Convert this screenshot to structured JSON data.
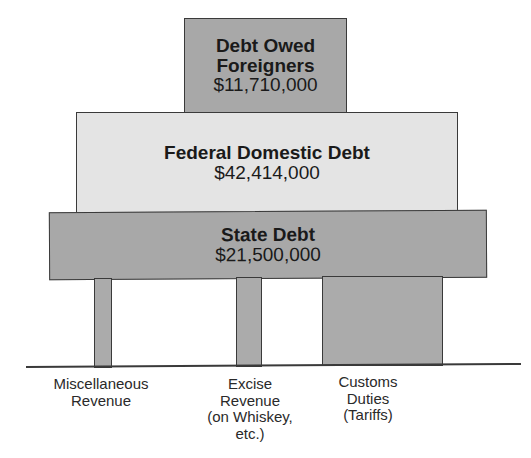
{
  "diagram": {
    "blocks": {
      "foreign_debt": {
        "title_line1": "Debt Owed",
        "title_line2": "Foreigners",
        "amount": "$11,710,000"
      },
      "federal_domestic_debt": {
        "title": "Federal Domestic Debt",
        "amount": "$42,414,000"
      },
      "state_debt": {
        "title": "State Debt",
        "amount": "$21,500,000"
      }
    },
    "supports": [
      {
        "label_lines": [
          "Miscellaneous",
          "Revenue"
        ]
      },
      {
        "label_lines": [
          "Excise",
          "Revenue",
          "(on Whiskey,",
          "etc.)"
        ]
      },
      {
        "label_lines": [
          "Customs",
          "Duties",
          "(Tariffs)"
        ]
      }
    ],
    "colors": {
      "dark_fill": "#a8a8a8",
      "light_fill": "#e4e4e4",
      "outline": "#3a3a3a"
    }
  }
}
